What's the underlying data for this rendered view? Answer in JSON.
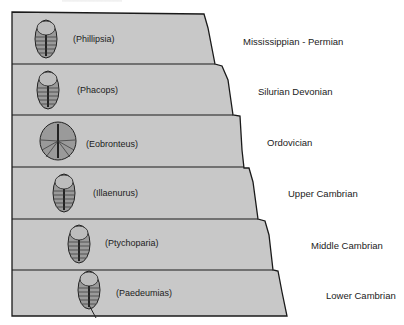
{
  "diagram": {
    "type": "stratigraphic-column",
    "layer_fill": "#c8c8c8",
    "outline_color": "#1a1a1a",
    "layers": [
      {
        "genus": "(Phillipsia)",
        "period": "Mississippian - Permian"
      },
      {
        "genus": "(Phacops)",
        "period": "Silurian Devonian"
      },
      {
        "genus": "(Eobronteus)",
        "period": "Ordovician"
      },
      {
        "genus": "(Illaenurus)",
        "period": "Upper Cambrian"
      },
      {
        "genus": "(Ptychoparia)",
        "period": "Middle Cambrian"
      },
      {
        "genus": "(Paedeumias)",
        "period": "Lower Cambrian"
      }
    ]
  }
}
